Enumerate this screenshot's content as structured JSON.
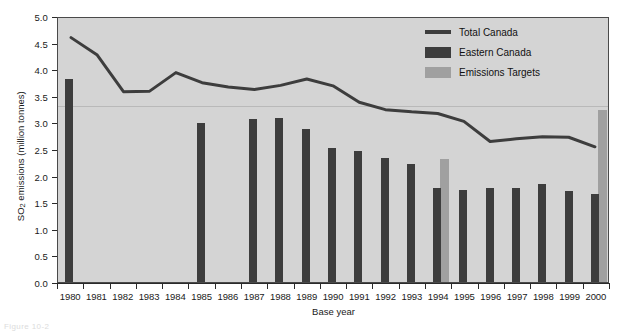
{
  "chart_data": {
    "type": "bar",
    "title": "",
    "xlabel": "Base year",
    "ylabel": "SO2 emissions (million tonnes)",
    "ylabel_parts": {
      "main_pre": "SO",
      "sub": "2",
      "main_post": " emissions (million tonnes)"
    },
    "ylim": [
      0.0,
      5.0
    ],
    "ytick_labels": [
      "5.0",
      "4.5",
      "4.0",
      "3.5",
      "3.0",
      "2.5",
      "2.0",
      "1.5",
      "1.0",
      "0.5",
      "0.0"
    ],
    "ytick_values": [
      5.0,
      4.5,
      4.0,
      3.5,
      3.0,
      2.5,
      2.0,
      1.5,
      1.0,
      0.5,
      0.0
    ],
    "grid": true,
    "gridlines": [
      3.35
    ],
    "categories": [
      "1980",
      "1981",
      "1982",
      "1983",
      "1984",
      "1985",
      "1986",
      "1987",
      "1988",
      "1989",
      "1990",
      "1991",
      "1992",
      "1993",
      "1994",
      "1995",
      "1996",
      "1997",
      "1998",
      "1999",
      "2000"
    ],
    "series": [
      {
        "name": "Total Canada",
        "type": "line",
        "color": "#3d3d3d",
        "values": [
          4.63,
          4.3,
          3.61,
          3.62,
          3.97,
          3.78,
          3.7,
          3.65,
          3.73,
          3.85,
          3.72,
          3.41,
          3.27,
          3.23,
          3.2,
          3.05,
          2.67,
          2.72,
          2.76,
          2.75,
          2.57
        ]
      },
      {
        "name": "Eastern Canada",
        "type": "bar",
        "color": "#3d3d3d",
        "values": [
          3.81,
          null,
          null,
          null,
          null,
          2.98,
          null,
          3.07,
          3.09,
          2.88,
          2.51,
          2.47,
          2.34,
          2.21,
          1.76,
          1.73,
          1.77,
          1.77,
          1.85,
          1.72,
          1.65
        ]
      },
      {
        "name": "Emissions Targets",
        "type": "bar",
        "color": "#a0a0a0",
        "values": [
          null,
          null,
          null,
          null,
          null,
          null,
          null,
          null,
          null,
          null,
          null,
          null,
          null,
          null,
          2.32,
          null,
          null,
          null,
          null,
          null,
          3.23
        ]
      }
    ],
    "legend_position": "top-right",
    "plot_background": "#d4d4d4",
    "axis_color": "#2a2a2a"
  },
  "legend": {
    "items": [
      {
        "label": "Total Canada",
        "swatch": "line-swatch",
        "color": "#3d3d3d"
      },
      {
        "label": "Eastern Canada",
        "swatch": "bar-swatch-dark",
        "color": "#3d3d3d"
      },
      {
        "label": "Emissions Targets",
        "swatch": "bar-swatch-gray",
        "color": "#a0a0a0"
      }
    ]
  },
  "caption": {
    "text": "Figure 10-2"
  }
}
